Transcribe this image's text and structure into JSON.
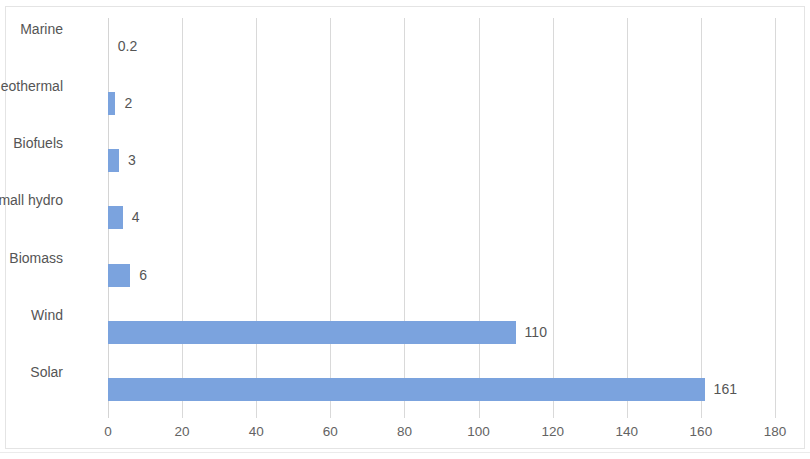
{
  "chart_data": {
    "type": "bar",
    "orientation": "horizontal",
    "title": "",
    "subtitle": "",
    "xlabel": "",
    "ylabel": "",
    "categories": [
      "Marine",
      "Geothermal",
      "Biofuels",
      "Small hydro",
      "Biomass",
      "Wind",
      "Solar"
    ],
    "values": [
      0.2,
      2,
      3,
      4,
      6,
      110,
      161
    ],
    "value_labels": [
      "0.2",
      "2",
      "3",
      "4",
      "6",
      "110",
      "161"
    ],
    "series": [
      {
        "name": "",
        "values": [
          0.2,
          2,
          3,
          4,
          6,
          110,
          161
        ]
      }
    ],
    "xlim": [
      0,
      180
    ],
    "xticks": [
      0,
      20,
      40,
      60,
      80,
      100,
      120,
      140,
      160,
      180
    ],
    "xtick_labels": [
      "0",
      "20",
      "40",
      "60",
      "80",
      "100",
      "120",
      "140",
      "160",
      "180"
    ],
    "grid": "vertical",
    "legend": "none",
    "data_labels": true,
    "bar_color": "#7BA3DE",
    "gridline_color": "#D9D9D9",
    "text_color": "#555555",
    "tick_text_color": "#636363",
    "background_color": "#FFFFFF"
  }
}
